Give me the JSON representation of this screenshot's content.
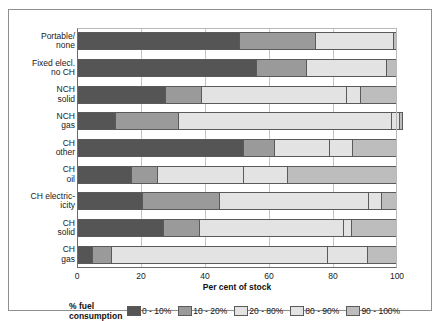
{
  "chart_data": {
    "type": "bar",
    "orientation": "horizontal",
    "stacked": true,
    "title": "",
    "xlabel": "Per cent of stock",
    "ylabel": "",
    "xlim": [
      0,
      100
    ],
    "xticks": [
      0,
      20,
      40,
      60,
      80,
      100
    ],
    "grid": true,
    "legend_position": "bottom",
    "legend_title": "% fuel consumption",
    "categories": [
      "Portable/ none",
      "Fixed elecl. no CH",
      "NCH solid",
      "NCH gas",
      "CH other",
      "CH oil",
      "CH electric- icity",
      "CH solid",
      "CH gas"
    ],
    "category_lines": [
      [
        "Portable/",
        "none"
      ],
      [
        "Fixed elecl.",
        "no CH"
      ],
      [
        "NCH",
        "solid"
      ],
      [
        "NCH",
        "gas"
      ],
      [
        "CH",
        "other"
      ],
      [
        "CH",
        "oil"
      ],
      [
        "CH electric-",
        "icity"
      ],
      [
        "CH",
        "solid"
      ],
      [
        "CH",
        "gas"
      ]
    ],
    "series": [
      {
        "name": "0 - 10%",
        "color": "#555555",
        "values": [
          50.6,
          56.0,
          27.5,
          12.0,
          52.0,
          17.0,
          20.3,
          27.0,
          4.7
        ]
      },
      {
        "name": "10 - 20%",
        "color": "#9a9a9a",
        "values": [
          23.8,
          15.5,
          11.3,
          19.5,
          9.5,
          8.0,
          24.1,
          11.0,
          5.9
        ]
      },
      {
        "name": "20 - 80%",
        "color": "#e3e3e3",
        "values": [
          24.3,
          25.0,
          45.2,
          66.5,
          17.3,
          27.0,
          46.6,
          45.0,
          67.4
        ]
      },
      {
        "name": "80 - 90%",
        "color": "#e3e3e3",
        "values": [
          0.0,
          0.0,
          4.4,
          2.5,
          7.2,
          13.6,
          4.0,
          2.6,
          12.6
        ]
      },
      {
        "name": "90 - 100%",
        "color": "#bdbdbd",
        "values": [
          1.3,
          3.5,
          11.6,
          1.5,
          14.0,
          34.4,
          5.0,
          14.4,
          9.4
        ]
      }
    ]
  }
}
